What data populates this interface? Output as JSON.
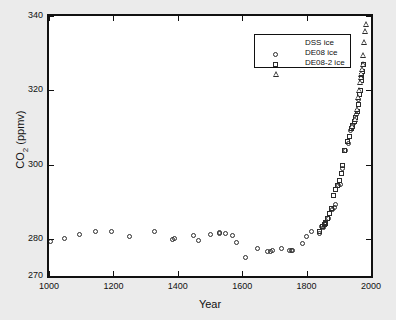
{
  "chart_data": {
    "type": "scatter",
    "title": "",
    "xlabel": "Year",
    "ylabel": "CO2 (ppmv)",
    "ylabel_parts": {
      "base": "CO",
      "sub": "2",
      "unit": " (ppmv)"
    },
    "xlim": [
      1000,
      2000
    ],
    "ylim": [
      270,
      340
    ],
    "xticks": [
      1000,
      1200,
      1400,
      1600,
      1800,
      2000
    ],
    "yticks": [
      270,
      280,
      300,
      320,
      340
    ],
    "xtick_labels": [
      "1000",
      "1200",
      "1400",
      "1600",
      "1800",
      "2000"
    ],
    "ytick_labels": [
      "270",
      "280",
      "300",
      "320",
      "340"
    ],
    "grid": false,
    "legend_position": "top-center",
    "series": [
      {
        "name": "DSS ice",
        "marker": "circle",
        "points": [
          [
            1006,
            279.4
          ],
          [
            1048,
            280.1
          ],
          [
            1096,
            281.2
          ],
          [
            1143,
            282.0
          ],
          [
            1194,
            282.0
          ],
          [
            1250,
            280.7
          ],
          [
            1327,
            282.0
          ],
          [
            1384,
            279.8
          ],
          [
            1389,
            280.0
          ],
          [
            1448,
            280.8
          ],
          [
            1465,
            279.5
          ],
          [
            1502,
            281.1
          ],
          [
            1528,
            281.7
          ],
          [
            1530,
            281.5
          ],
          [
            1547,
            281.5
          ],
          [
            1570,
            280.8
          ],
          [
            1581,
            278.9
          ],
          [
            1610,
            274.9
          ],
          [
            1649,
            277.3
          ],
          [
            1680,
            276.5
          ],
          [
            1689,
            276.7
          ],
          [
            1694,
            276.9
          ],
          [
            1723,
            277.5
          ],
          [
            1748,
            276.9
          ],
          [
            1754,
            276.8
          ],
          [
            1757,
            276.9
          ],
          [
            1786,
            278.8
          ],
          [
            1800,
            280.6
          ],
          [
            1814,
            282.0
          ],
          [
            1840,
            281.5
          ],
          [
            1846,
            283.2
          ],
          [
            1852,
            283.1
          ],
          [
            1858,
            284.3
          ],
          [
            1868,
            285.4
          ],
          [
            1879,
            287.8
          ],
          [
            1886,
            288.4
          ],
          [
            1891,
            289.3
          ],
          [
            1898,
            294.4
          ],
          [
            1905,
            294.6
          ],
          [
            1910,
            299.0
          ],
          [
            1920,
            303.9
          ],
          [
            1929,
            305.6
          ],
          [
            1937,
            309.1
          ],
          [
            1944,
            310.0
          ],
          [
            1950,
            311.3
          ],
          [
            1956,
            313.5
          ],
          [
            1962,
            317.6
          ]
        ]
      },
      {
        "name": "DE08 ice",
        "marker": "square",
        "points": [
          [
            1841,
            282.0
          ],
          [
            1849,
            283.4
          ],
          [
            1855,
            283.8
          ],
          [
            1858,
            284.1
          ],
          [
            1860,
            284.5
          ],
          [
            1866,
            285.4
          ],
          [
            1871,
            286.9
          ],
          [
            1878,
            288.1
          ],
          [
            1884,
            291.7
          ],
          [
            1890,
            293.2
          ],
          [
            1896,
            294.3
          ],
          [
            1901,
            295.6
          ],
          [
            1907,
            297.5
          ],
          [
            1912,
            299.8
          ],
          [
            1919,
            303.7
          ],
          [
            1927,
            306.3
          ],
          [
            1932,
            307.6
          ],
          [
            1938,
            309.8
          ],
          [
            1943,
            310.6
          ],
          [
            1948,
            311.5
          ],
          [
            1953,
            312.6
          ],
          [
            1957,
            314.4
          ],
          [
            1960,
            316.1
          ],
          [
            1963,
            318.8
          ],
          [
            1966,
            319.9
          ],
          [
            1969,
            322.6
          ],
          [
            1972,
            324.0
          ],
          [
            1975,
            325.0
          ],
          [
            1978,
            327.0
          ]
        ]
      },
      {
        "name": "DE08-2 ice",
        "marker": "triangle",
        "points": [
          [
            1944,
            310.4
          ],
          [
            1952,
            312.2
          ],
          [
            1958,
            315.0
          ],
          [
            1962,
            318.1
          ],
          [
            1965,
            320.0
          ],
          [
            1968,
            322.3
          ],
          [
            1970,
            323.6
          ],
          [
            1972,
            324.5
          ],
          [
            1974,
            325.6
          ],
          [
            1976,
            327.1
          ],
          [
            1978,
            329.5
          ],
          [
            1980,
            333.0
          ],
          [
            1983,
            336.0
          ],
          [
            1986,
            337.8
          ]
        ]
      }
    ]
  },
  "legend": {
    "entries": [
      {
        "label": "DSS ice",
        "marker": "circle"
      },
      {
        "label": "DE08 ice",
        "marker": "square"
      },
      {
        "label": "DE08-2 ice",
        "marker": "triangle"
      }
    ]
  }
}
